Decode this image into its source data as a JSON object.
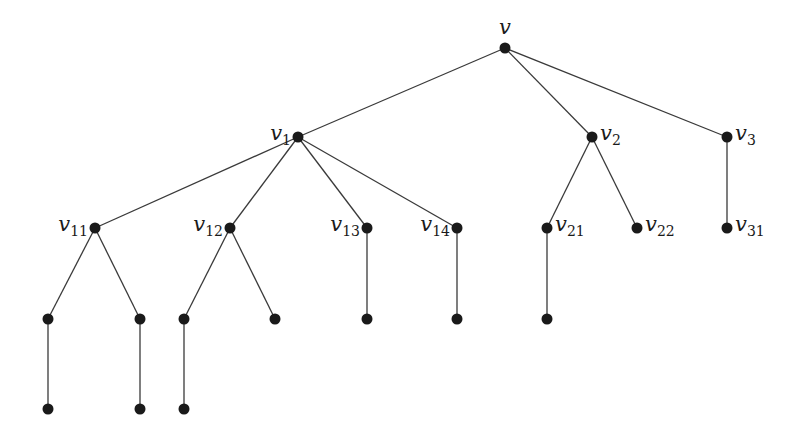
{
  "diagram": {
    "type": "rooted-tree",
    "colors": {
      "edge": "#3a3a3a",
      "node": "#1a1a1a",
      "background": "#ffffff"
    },
    "nodes": [
      {
        "id": "v",
        "x": 505,
        "y": 48,
        "label": "v",
        "sub": "",
        "label_pos": "above"
      },
      {
        "id": "v1",
        "x": 298,
        "y": 137,
        "label": "v",
        "sub": "1",
        "label_pos": "left"
      },
      {
        "id": "v2",
        "x": 592,
        "y": 137,
        "label": "v",
        "sub": "2",
        "label_pos": "right"
      },
      {
        "id": "v3",
        "x": 727,
        "y": 137,
        "label": "v",
        "sub": "3",
        "label_pos": "right"
      },
      {
        "id": "v11",
        "x": 95,
        "y": 228,
        "label": "v",
        "sub": "11",
        "label_pos": "left"
      },
      {
        "id": "v12",
        "x": 230,
        "y": 228,
        "label": "v",
        "sub": "12",
        "label_pos": "left"
      },
      {
        "id": "v13",
        "x": 367,
        "y": 228,
        "label": "v",
        "sub": "13",
        "label_pos": "left"
      },
      {
        "id": "v14",
        "x": 457,
        "y": 228,
        "label": "v",
        "sub": "14",
        "label_pos": "left"
      },
      {
        "id": "v21",
        "x": 547,
        "y": 228,
        "label": "v",
        "sub": "21",
        "label_pos": "right"
      },
      {
        "id": "v22",
        "x": 637,
        "y": 228,
        "label": "v",
        "sub": "22",
        "label_pos": "right"
      },
      {
        "id": "v31",
        "x": 727,
        "y": 228,
        "label": "v",
        "sub": "31",
        "label_pos": "right"
      },
      {
        "id": "a1",
        "x": 48,
        "y": 319,
        "label": "",
        "sub": "",
        "label_pos": "none"
      },
      {
        "id": "a2",
        "x": 140,
        "y": 319,
        "label": "",
        "sub": "",
        "label_pos": "none"
      },
      {
        "id": "a3",
        "x": 184,
        "y": 319,
        "label": "",
        "sub": "",
        "label_pos": "none"
      },
      {
        "id": "a4",
        "x": 275,
        "y": 319,
        "label": "",
        "sub": "",
        "label_pos": "none"
      },
      {
        "id": "a5",
        "x": 367,
        "y": 319,
        "label": "",
        "sub": "",
        "label_pos": "none"
      },
      {
        "id": "a6",
        "x": 457,
        "y": 319,
        "label": "",
        "sub": "",
        "label_pos": "none"
      },
      {
        "id": "a7",
        "x": 547,
        "y": 319,
        "label": "",
        "sub": "",
        "label_pos": "none"
      },
      {
        "id": "b1",
        "x": 48,
        "y": 409,
        "label": "",
        "sub": "",
        "label_pos": "none"
      },
      {
        "id": "b2",
        "x": 140,
        "y": 409,
        "label": "",
        "sub": "",
        "label_pos": "none"
      },
      {
        "id": "b3",
        "x": 184,
        "y": 409,
        "label": "",
        "sub": "",
        "label_pos": "none"
      }
    ],
    "edges": [
      [
        "v",
        "v1"
      ],
      [
        "v",
        "v2"
      ],
      [
        "v",
        "v3"
      ],
      [
        "v1",
        "v11"
      ],
      [
        "v1",
        "v12"
      ],
      [
        "v1",
        "v13"
      ],
      [
        "v1",
        "v14"
      ],
      [
        "v2",
        "v21"
      ],
      [
        "v2",
        "v22"
      ],
      [
        "v3",
        "v31"
      ],
      [
        "v11",
        "a1"
      ],
      [
        "v11",
        "a2"
      ],
      [
        "v12",
        "a3"
      ],
      [
        "v12",
        "a4"
      ],
      [
        "v13",
        "a5"
      ],
      [
        "v14",
        "a6"
      ],
      [
        "v21",
        "a7"
      ],
      [
        "a1",
        "b1"
      ],
      [
        "a2",
        "b2"
      ],
      [
        "a3",
        "b3"
      ]
    ]
  }
}
